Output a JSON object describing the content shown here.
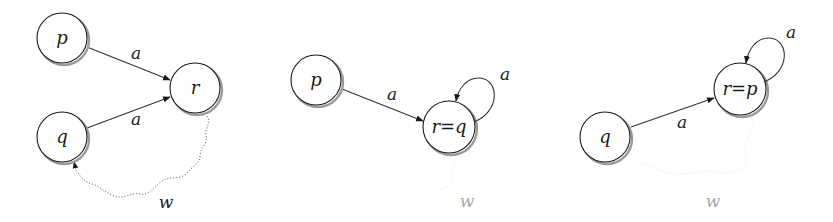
{
  "panels": [
    {
      "nodes": {
        "p": "p",
        "q": "q",
        "r": "r"
      },
      "edges": [
        {
          "from": "p",
          "to": "r",
          "label": "a"
        },
        {
          "from": "q",
          "to": "r",
          "label": "a"
        }
      ],
      "path": {
        "from": "r",
        "to": "q",
        "label": "w",
        "style": "dotted-wavy"
      }
    },
    {
      "nodes": {
        "p": "p",
        "merged": "r=q"
      },
      "edges": [
        {
          "from": "p",
          "to": "r=q",
          "label": "a"
        },
        {
          "from": "r=q",
          "to": "r=q",
          "label": "a",
          "type": "self-loop"
        }
      ],
      "path": {
        "label": "w",
        "style": "faint"
      }
    },
    {
      "nodes": {
        "q": "q",
        "merged": "r=p"
      },
      "edges": [
        {
          "from": "q",
          "to": "r=p",
          "label": "a"
        },
        {
          "from": "r=p",
          "to": "r=p",
          "label": "a",
          "type": "self-loop"
        }
      ],
      "path": {
        "label": "w",
        "style": "faint"
      }
    }
  ]
}
